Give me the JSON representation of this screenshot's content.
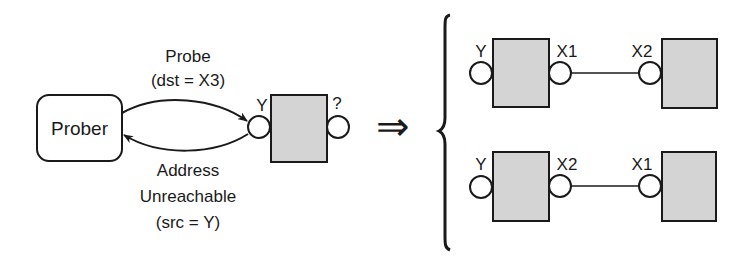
{
  "colors": {
    "stroke": "#1a1a1a",
    "router_fill": "#d4d4d4",
    "background": "#ffffff"
  },
  "left": {
    "prober_label": "Prober",
    "probe_line1": "Probe",
    "probe_line2": "(dst = X3)",
    "reply_line1": "Address",
    "reply_line2": "Unreachable",
    "reply_line3": "(src = Y)",
    "router_in_label": "Y",
    "router_out_label": "?"
  },
  "implies_symbol": "⇒",
  "right": {
    "cases": [
      {
        "near_in": "Y",
        "near_out": "X1",
        "far_in": "X2"
      },
      {
        "near_in": "Y",
        "near_out": "X2",
        "far_in": "X1"
      }
    ]
  }
}
